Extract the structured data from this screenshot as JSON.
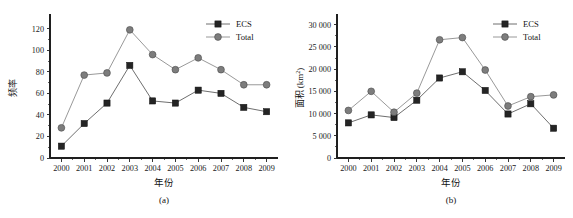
{
  "figure": {
    "background_color": "#ffffff",
    "series_colors": {
      "ecs": "#242424",
      "total": "#7d7d7d"
    },
    "legend_labels": {
      "ecs": "ECS",
      "total": "Total"
    }
  },
  "panels": [
    {
      "caption": "(a)",
      "chart_data": {
        "type": "line",
        "title": "",
        "xlabel": "年份",
        "ylabel": "频率",
        "ylabel_plain": "频率",
        "categories": [
          "2000",
          "2001",
          "2002",
          "2003",
          "2004",
          "2005",
          "2006",
          "2007",
          "2008",
          "2009"
        ],
        "x": [
          2000,
          2001,
          2002,
          2003,
          2004,
          2005,
          2006,
          2007,
          2008,
          2009
        ],
        "series": [
          {
            "name": "ECS",
            "marker": "square",
            "color": "#242424",
            "values": [
              11,
              32,
              51,
              86,
              53,
              51,
              63,
              60,
              47,
              43
            ]
          },
          {
            "name": "Total",
            "marker": "circle",
            "color": "#7d7d7d",
            "values": [
              28,
              77,
              79,
              119,
              96,
              82,
              93,
              82,
              68,
              68
            ]
          }
        ],
        "ylim": [
          0,
          130
        ],
        "yticks": [
          0,
          20,
          40,
          60,
          80,
          100,
          120
        ],
        "ytick_labels": [
          "0",
          "20",
          "40",
          "60",
          "80",
          "100",
          "120"
        ],
        "xlim": [
          1999.5,
          2009.5
        ],
        "grid": false,
        "legend_position": "top-right"
      }
    },
    {
      "caption": "(b)",
      "chart_data": {
        "type": "line",
        "title": "",
        "xlabel": "年份",
        "ylabel": "面积 (km2)",
        "ylabel_plain": "面积 (km",
        "ylabel_sup": "2",
        "ylabel_tail": ")",
        "categories": [
          "2000",
          "2001",
          "2002",
          "2003",
          "2004",
          "2005",
          "2006",
          "2007",
          "2008",
          "2009"
        ],
        "x": [
          2000,
          2001,
          2002,
          2003,
          2004,
          2005,
          2006,
          2007,
          2008,
          2009
        ],
        "series": [
          {
            "name": "ECS",
            "marker": "square",
            "color": "#242424",
            "values": [
              7900,
              9700,
              9100,
              13000,
              18000,
              19400,
              15200,
              9900,
              12200,
              6700
            ]
          },
          {
            "name": "Total",
            "marker": "circle",
            "color": "#7d7d7d",
            "values": [
              10700,
              15000,
              10300,
              14600,
              26600,
              27100,
              19800,
              11700,
              13800,
              14200
            ]
          }
        ],
        "ylim": [
          0,
          31500
        ],
        "yticks": [
          0,
          5000,
          10000,
          15000,
          20000,
          25000,
          30000
        ],
        "ytick_labels": [
          "0",
          "5 000",
          "10 000",
          "15 000",
          "20 000",
          "25 000",
          "30 000"
        ],
        "xlim": [
          1999.5,
          2009.5
        ],
        "grid": false,
        "legend_position": "top-right"
      }
    }
  ]
}
